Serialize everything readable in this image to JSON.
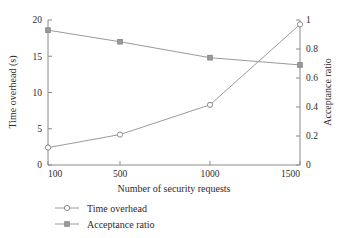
{
  "chart_data": {
    "type": "line",
    "title": "",
    "xlabel": "Number of security requests",
    "ylabel": "Time overhead (s)",
    "y2label": "Acceptance ratio",
    "x": [
      100,
      500,
      1000,
      1500
    ],
    "xlim": [
      100,
      1500
    ],
    "xticks": [
      100,
      500,
      1000,
      1500
    ],
    "xticklabels": [
      "100",
      "500",
      "1000",
      "1500"
    ],
    "ylim": [
      0,
      20
    ],
    "yticks": [
      0,
      5,
      10,
      15,
      20
    ],
    "yticklabels": [
      "0",
      "5",
      "10",
      "15",
      "20"
    ],
    "y2lim": [
      0,
      1
    ],
    "y2ticks": [
      0,
      0.2,
      0.4,
      0.6,
      0.8,
      1
    ],
    "y2ticklabels": [
      "0",
      "0.2",
      "0.4",
      "0.6",
      "0.8",
      "1"
    ],
    "grid": false,
    "legend_position": "below-left",
    "series": [
      {
        "name": "Time overhead",
        "axis": "left",
        "marker": "open-circle",
        "color": "#9a9a9a",
        "values": [
          2.4,
          4.2,
          8.3,
          19.4
        ]
      },
      {
        "name": "Acceptance ratio",
        "axis": "right",
        "marker": "filled-square",
        "color": "#9a9a9a",
        "values": [
          0.93,
          0.85,
          0.74,
          0.69
        ]
      }
    ]
  },
  "legend": {
    "items": [
      {
        "label": "Time overhead",
        "marker": "open-circle"
      },
      {
        "label": "Acceptance ratio",
        "marker": "filled-square"
      }
    ]
  },
  "colors": {
    "line": "#9a9a9a",
    "axis": "#8a8a8a",
    "text": "#2b2b2b",
    "background": "#ffffff"
  }
}
